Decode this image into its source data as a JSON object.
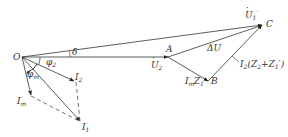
{
  "diagram": {
    "type": "phasor-diagram",
    "points": {
      "O": {
        "label": "O"
      },
      "A": {
        "label": "A"
      },
      "B": {
        "label": "B"
      },
      "C": {
        "label": "C"
      }
    },
    "phasors": {
      "U1p": {
        "label": "U",
        "sub": "1",
        "prime": "′",
        "desc": "U1' from O to C"
      },
      "U2": {
        "label": "U",
        "sub": "2",
        "desc": "U2 from O to A"
      },
      "dU": {
        "label": "ΔU",
        "desc": "ΔU from A to C"
      },
      "ImZ1": {
        "label": "I",
        "sub": "m",
        "prime": "′",
        "tail": "Z",
        "tail_sub": "1",
        "tail_prime": "′",
        "desc": "I'm Z1' from A to B"
      },
      "I2Z": {
        "label": "I",
        "sub": "2",
        "tail": "(Z",
        "tail_sub": "2",
        "mid": "+Z",
        "mid_sub": "1",
        "end": "′)",
        "desc": "I2(Z2+Z1') from B to C"
      },
      "I2": {
        "label": "I",
        "sub": "2"
      },
      "Im": {
        "label": "I",
        "sub": "m",
        "prime": "′"
      },
      "I1p": {
        "label": "I",
        "sub": "1",
        "prime": "′"
      }
    },
    "angles": {
      "delta": "δ",
      "phi2": {
        "label": "φ",
        "sub": "2"
      },
      "phim": {
        "label": "φ",
        "sub": "m"
      }
    },
    "colors": {
      "line": "#333333",
      "text": "#333333"
    }
  }
}
